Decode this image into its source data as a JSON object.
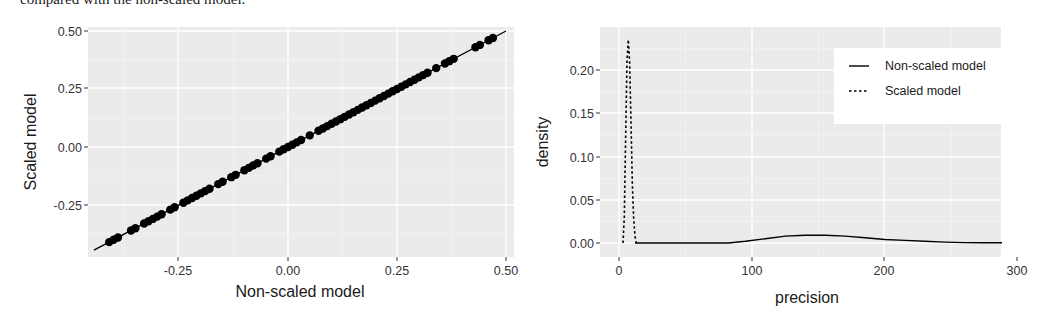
{
  "caption": "compared with the non-scaled model.",
  "chart_data": [
    {
      "type": "scatter",
      "title": "",
      "xlabel": "Non-scaled model",
      "ylabel": "Scaled model",
      "xlim": [
        -0.43,
        0.52
      ],
      "ylim": [
        -0.43,
        0.51
      ],
      "x_ticks": [
        "-0.25",
        "0.00",
        "0.25",
        "0.50"
      ],
      "y_ticks": [
        "0.50",
        "0.25",
        "0.00",
        "-0.25"
      ],
      "grid": true,
      "reference_line": {
        "slope": 1,
        "intercept": 0
      },
      "points_description": "Points lie exactly on the y = x identity line, ranging from about -0.41 to 0.47",
      "x": [
        -0.41,
        -0.4,
        -0.39,
        -0.36,
        -0.35,
        -0.33,
        -0.32,
        -0.31,
        -0.3,
        -0.29,
        -0.27,
        -0.26,
        -0.24,
        -0.23,
        -0.22,
        -0.21,
        -0.2,
        -0.19,
        -0.18,
        -0.16,
        -0.15,
        -0.13,
        -0.12,
        -0.1,
        -0.09,
        -0.08,
        -0.07,
        -0.05,
        -0.04,
        -0.02,
        -0.01,
        0.0,
        0.01,
        0.02,
        0.03,
        0.05,
        0.07,
        0.08,
        0.09,
        0.1,
        0.11,
        0.12,
        0.13,
        0.14,
        0.15,
        0.16,
        0.17,
        0.18,
        0.19,
        0.2,
        0.21,
        0.22,
        0.23,
        0.24,
        0.25,
        0.26,
        0.27,
        0.28,
        0.29,
        0.3,
        0.31,
        0.32,
        0.34,
        0.36,
        0.37,
        0.38,
        0.43,
        0.44,
        0.46,
        0.47
      ],
      "y": [
        -0.41,
        -0.4,
        -0.39,
        -0.36,
        -0.35,
        -0.33,
        -0.32,
        -0.31,
        -0.3,
        -0.29,
        -0.27,
        -0.26,
        -0.24,
        -0.23,
        -0.22,
        -0.21,
        -0.2,
        -0.19,
        -0.18,
        -0.16,
        -0.15,
        -0.13,
        -0.12,
        -0.1,
        -0.09,
        -0.08,
        -0.07,
        -0.05,
        -0.04,
        -0.02,
        -0.01,
        0.0,
        0.01,
        0.02,
        0.03,
        0.05,
        0.07,
        0.08,
        0.09,
        0.1,
        0.11,
        0.12,
        0.13,
        0.14,
        0.15,
        0.16,
        0.17,
        0.18,
        0.19,
        0.2,
        0.21,
        0.22,
        0.23,
        0.24,
        0.25,
        0.26,
        0.27,
        0.28,
        0.29,
        0.3,
        0.31,
        0.32,
        0.34,
        0.36,
        0.37,
        0.38,
        0.43,
        0.44,
        0.46,
        0.47
      ]
    },
    {
      "type": "line",
      "subtype": "density",
      "title": "",
      "xlabel": "precision",
      "ylabel": "density",
      "xlim": [
        -15,
        300
      ],
      "ylim": [
        -0.01,
        0.24
      ],
      "x_ticks": [
        "0",
        "100",
        "200",
        "300"
      ],
      "y_ticks": [
        "0.20",
        "0.15",
        "0.10",
        "0.05",
        "0.00"
      ],
      "grid": true,
      "legend_position": "top-right-inside",
      "series": [
        {
          "name": "Non-scaled model",
          "linetype": "solid",
          "x": [
            12,
            30,
            50,
            70,
            82,
            95,
            110,
            125,
            140,
            155,
            170,
            185,
            200,
            215,
            230,
            245,
            260,
            275,
            288
          ],
          "y": [
            0.0,
            0.0,
            0.0,
            0.0,
            0.0,
            0.002,
            0.005,
            0.008,
            0.009,
            0.009,
            0.008,
            0.006,
            0.004,
            0.003,
            0.002,
            0.001,
            0.0005,
            0.0003,
            0.0002
          ]
        },
        {
          "name": "Scaled model",
          "linetype": "dashed",
          "x": [
            3,
            4,
            5,
            6,
            7,
            8,
            9,
            10,
            11,
            12,
            13
          ],
          "y": [
            0.0,
            0.03,
            0.12,
            0.21,
            0.235,
            0.21,
            0.14,
            0.07,
            0.03,
            0.008,
            0.0
          ]
        }
      ]
    }
  ],
  "left_panel": {
    "ylabel": "Scaled model",
    "xlabel": "Non-scaled model",
    "y_ticks": [
      {
        "label": "0.50",
        "y": 31
      },
      {
        "label": "0.25",
        "y": 88
      },
      {
        "label": "0.00",
        "y": 147
      },
      {
        "label": "-0.25",
        "y": 205
      }
    ],
    "x_ticks": [
      {
        "label": "-0.25",
        "x": 178
      },
      {
        "label": "0.00",
        "x": 288
      },
      {
        "label": "0.25",
        "x": 397
      },
      {
        "label": "0.50",
        "x": 506
      }
    ]
  },
  "right_panel": {
    "ylabel": "density",
    "xlabel": "precision",
    "y_ticks": [
      {
        "label": "0.20",
        "y": 70
      },
      {
        "label": "0.15",
        "y": 113
      },
      {
        "label": "0.10",
        "y": 157
      },
      {
        "label": "0.05",
        "y": 200
      },
      {
        "label": "0.00",
        "y": 243
      }
    ],
    "x_ticks": [
      {
        "label": "0",
        "x": 619
      },
      {
        "label": "100",
        "x": 752
      },
      {
        "label": "200",
        "x": 884
      },
      {
        "label": "300",
        "x": 1017
      }
    ],
    "legend": [
      {
        "label": "Non-scaled model",
        "linetype": "solid"
      },
      {
        "label": "Scaled model",
        "linetype": "dashed"
      }
    ]
  },
  "colors": {
    "panel_bg": "#ebebeb",
    "grid_major": "#ffffff",
    "grid_minor": "#f5f5f5",
    "ink": "#000000",
    "tick_text": "#4d4d4d"
  }
}
